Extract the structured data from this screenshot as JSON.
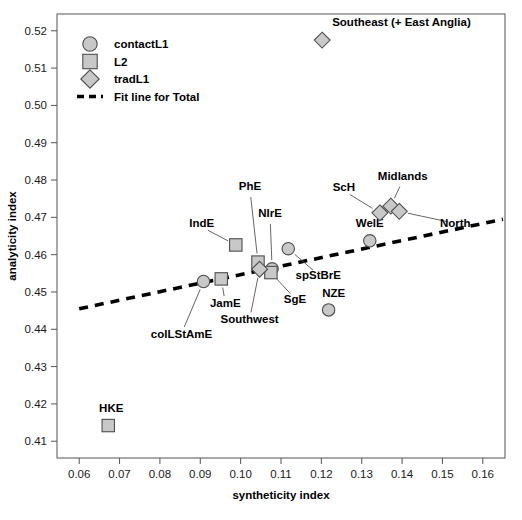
{
  "chart_data": {
    "type": "scatter",
    "title": "",
    "xlabel": "syntheticity index",
    "ylabel": "analyticity index",
    "xlim": [
      0.0545,
      0.1655
    ],
    "ylim": [
      0.4055,
      0.5245
    ],
    "xticks": [
      0.06,
      0.07,
      0.08,
      0.09,
      0.1,
      0.11,
      0.12,
      0.13,
      0.14,
      0.15,
      0.16
    ],
    "xticklabels": [
      "0.06",
      "0.07",
      "0.08",
      "0.09",
      "0.10",
      "0.11",
      "0.12",
      "0.13",
      "0.14",
      "0.15",
      "0.16"
    ],
    "yticks": [
      0.41,
      0.42,
      0.43,
      0.44,
      0.45,
      0.46,
      0.47,
      0.48,
      0.49,
      0.5,
      0.51,
      0.52
    ],
    "yticklabels": [
      "0.41",
      "0.42",
      "0.43",
      "0.44",
      "0.45",
      "0.46",
      "0.47",
      "0.48",
      "0.49",
      "0.50",
      "0.51",
      "0.52"
    ],
    "grid": false,
    "legend_position": "top-left",
    "legend": [
      {
        "label": "contactL1",
        "marker": "circle"
      },
      {
        "label": "L2",
        "marker": "square"
      },
      {
        "label": "tradL1",
        "marker": "diamond"
      },
      {
        "label": "Fit line for Total",
        "marker": "dashed-line"
      }
    ],
    "fit_line": {
      "label": "Fit line for Total",
      "x": [
        0.06,
        0.165
      ],
      "y": [
        0.4455,
        0.4695
      ],
      "style": "dashed",
      "color": "#000000"
    },
    "series": [
      {
        "name": "contactL1",
        "marker": "circle",
        "points": [
          {
            "label": "colLStAmE",
            "x": 0.0908,
            "y": 0.4528,
            "label_dx": -22,
            "label_dy": 52,
            "anchor": "middle"
          },
          {
            "label": "NIrE",
            "x": 0.1078,
            "y": 0.4562,
            "label_dx": -2,
            "label_dy": -52,
            "anchor": "middle"
          },
          {
            "label": "spStBrE",
            "x": 0.1118,
            "y": 0.4616,
            "label_dx": 30,
            "label_dy": 26,
            "anchor": "middle"
          },
          {
            "label": "WelE",
            "x": 0.132,
            "y": 0.4637,
            "label_dx": 0,
            "label_dy": -14,
            "anchor": "middle"
          },
          {
            "label": "NZE",
            "x": 0.1218,
            "y": 0.4452,
            "label_dx": 5,
            "label_dy": -13,
            "anchor": "middle"
          }
        ]
      },
      {
        "name": "L2",
        "marker": "square",
        "points": [
          {
            "label": "HKE",
            "x": 0.0672,
            "y": 0.4142,
            "label_dx": 3,
            "label_dy": -14,
            "anchor": "middle"
          },
          {
            "label": "JamE",
            "x": 0.0952,
            "y": 0.4535,
            "label_dx": 4,
            "label_dy": 24,
            "anchor": "middle"
          },
          {
            "label": "IndE",
            "x": 0.0988,
            "y": 0.4626,
            "label_dx": -34,
            "label_dy": -18,
            "anchor": "middle"
          },
          {
            "label": "PhE",
            "x": 0.1043,
            "y": 0.458,
            "label_dx": -8,
            "label_dy": -72,
            "anchor": "middle"
          },
          {
            "label": "SgE",
            "x": 0.1075,
            "y": 0.4552,
            "label_dx": 24,
            "label_dy": 26,
            "anchor": "middle"
          }
        ]
      },
      {
        "name": "tradL1",
        "marker": "diamond",
        "points": [
          {
            "label": "Southwest",
            "x": 0.1047,
            "y": 0.4561,
            "label_dx": -10,
            "label_dy": 50,
            "anchor": "middle"
          },
          {
            "label": "ScH",
            "x": 0.1345,
            "y": 0.4712,
            "label_dx": -36,
            "label_dy": -22,
            "anchor": "middle"
          },
          {
            "label": "Midlands",
            "x": 0.1372,
            "y": 0.473,
            "label_dx": 12,
            "label_dy": -26,
            "anchor": "middle"
          },
          {
            "label": "North",
            "x": 0.1393,
            "y": 0.4716,
            "label_dx": 56,
            "label_dy": 12,
            "anchor": "middle"
          },
          {
            "label": "Southeast (+ East Anglia)",
            "x": 0.1202,
            "y": 0.5175,
            "label_dx": 10,
            "label_dy": -14,
            "anchor": "start"
          }
        ]
      }
    ]
  },
  "caption": {
    "partial_text": ""
  },
  "colors": {
    "marker_fill": "#c8c8c8",
    "marker_stroke": "#4d4d4d",
    "line": "#000000",
    "axis": "#555555",
    "text": "#000000"
  }
}
